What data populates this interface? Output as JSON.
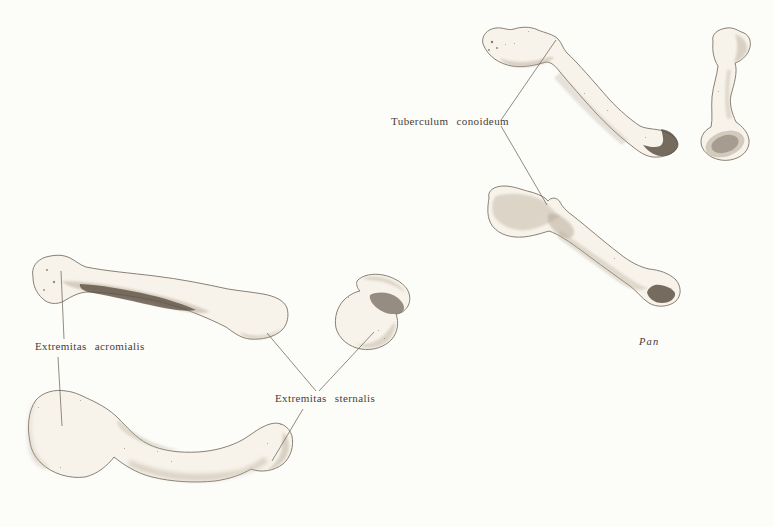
{
  "plate": {
    "labels": {
      "tuberculum": "Tuberculum conoideum",
      "acromialis": "Extremitas acromialis",
      "sternalis": "Extremitas sternalis"
    },
    "caption": {
      "genus": "Pan"
    },
    "colors": {
      "background": "#fcfcf9",
      "label_ink": "#45403a",
      "pointer_line": "#6e665a",
      "bone_fill": "#f7f3ea",
      "bone_outline": "#7c7366",
      "shading_mid": "#b4a795",
      "shading_dark": "#55493c"
    }
  }
}
